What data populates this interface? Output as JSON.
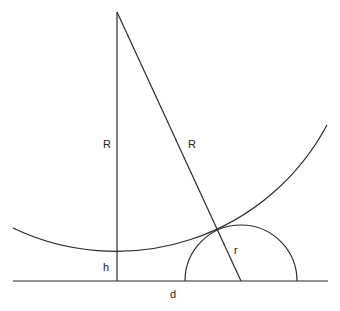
{
  "diagram": {
    "colors": {
      "stroke": "#2a2a2a",
      "background": "#ffffff"
    },
    "labels": {
      "vertical_R": "R",
      "slant_R": "R",
      "height": "h",
      "small_radius": "r",
      "distance": "d"
    },
    "geometry": {
      "apex": [
        117,
        12
      ],
      "baseline": {
        "x1": 13,
        "x2": 328,
        "y": 281
      },
      "large_circle": {
        "cx": 117,
        "cy": 12,
        "r": 239,
        "arc_start": [
          13,
          228
        ],
        "arc_end": [
          327,
          125
        ]
      },
      "small_semicircle": {
        "cx": 241,
        "cy": 281,
        "r": 56
      },
      "slant_line_end": [
        241,
        281
      ]
    }
  }
}
